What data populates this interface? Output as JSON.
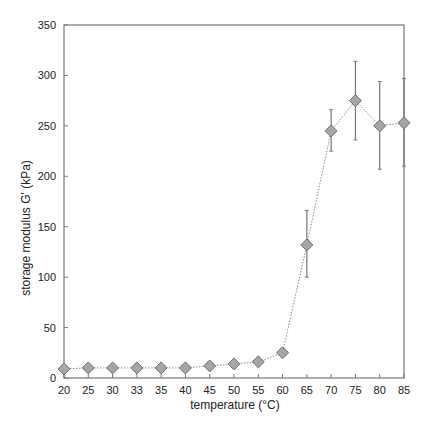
{
  "chart_data": {
    "type": "line",
    "title": "",
    "xlabel": "temperature (°C)",
    "ylabel": "storage modulus G' (kPa)",
    "categories": [
      "20",
      "25",
      "30",
      "33",
      "35",
      "40",
      "45",
      "50",
      "55",
      "60",
      "65",
      "70",
      "75",
      "80",
      "85"
    ],
    "series": [
      {
        "name": "G'",
        "values": [
          9,
          10,
          10,
          10,
          10,
          10,
          12,
          14,
          16,
          25,
          132,
          245,
          275,
          250,
          253
        ],
        "error_low": [
          9,
          10,
          10,
          10,
          10,
          10,
          12,
          14,
          16,
          22,
          100,
          225,
          236,
          207,
          210
        ],
        "error_high": [
          9,
          10,
          10,
          10,
          10,
          10,
          12,
          14,
          16,
          28,
          166,
          266,
          314,
          294,
          297
        ],
        "marker": "diamond",
        "line_style": "dotted"
      }
    ],
    "ylim": [
      0,
      350
    ],
    "yticks": [
      0,
      50,
      100,
      150,
      200,
      250,
      300,
      350
    ],
    "grid": false,
    "legend": "none",
    "colors": {
      "marker_fill": "#a6a6a6",
      "marker_edge": "#6e6e6e",
      "line": "#8a8a8a",
      "axis": "#777777",
      "error_bar": "#777777"
    }
  },
  "axes": {
    "x_label": "temperature (°C)",
    "y_label": "storage modulus G' (kPa)"
  }
}
